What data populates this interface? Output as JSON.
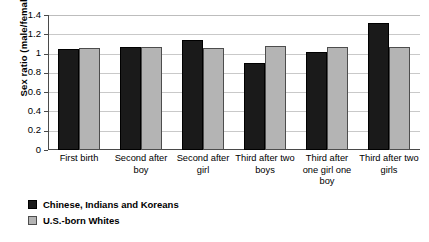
{
  "chart_data": {
    "type": "bar",
    "title": "",
    "subtitle": "",
    "xlabel": "",
    "ylabel": "Sex ratio (male/female)",
    "ylim": [
      0,
      1.4
    ],
    "ytick_values": [
      0,
      0.2,
      0.4,
      0.6,
      0.8,
      1,
      1.2,
      1.4
    ],
    "ytick_labels": [
      "0",
      "0.2",
      "0.4",
      "0.6",
      "0.8",
      "1",
      "1.2",
      "1.4"
    ],
    "grid": "horizontal",
    "legend_position": "below-left",
    "categories": [
      "First birth",
      "Second after boy",
      "Second after girl",
      "Third after two boys",
      "Third after one girl one boy",
      "Third after two girls"
    ],
    "series": [
      {
        "name": "Chinese, Indians and Koreans",
        "color": "#1a1a1a",
        "values": [
          1.05,
          1.07,
          1.14,
          0.9,
          1.02,
          1.32
        ]
      },
      {
        "name": "U.S.-born Whites",
        "color": "#b4b4b4",
        "values": [
          1.06,
          1.07,
          1.06,
          1.08,
          1.07,
          1.07
        ]
      }
    ]
  },
  "axis": {
    "y_title": "Sex ratio (male/female)"
  },
  "legend": {
    "items": [
      {
        "label": "Chinese, Indians and Koreans",
        "swatch": "black-square-swatch"
      },
      {
        "label": "U.S.-born Whites",
        "swatch": "gray-square-swatch"
      }
    ]
  }
}
